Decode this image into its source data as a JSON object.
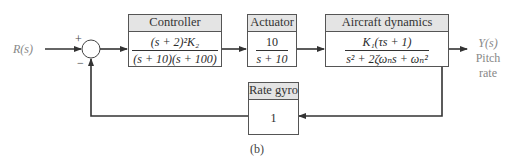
{
  "diagram": {
    "caption": "(b)",
    "input": {
      "label": "R(s)"
    },
    "summing_junction": {
      "plus_sign": "+",
      "minus_sign": "−"
    },
    "blocks": {
      "controller": {
        "title": "Controller",
        "numerator": "(s + 2)²K₂",
        "denominator": "(s + 10)(s + 100)"
      },
      "actuator": {
        "title": "Actuator",
        "numerator": "10",
        "denominator": "s + 10"
      },
      "aircraft": {
        "title": "Aircraft dynamics",
        "numerator": "K₁(τs + 1)",
        "denominator": "s² + 2ζωₙs + ωₙ²"
      },
      "rate_gyro": {
        "title": "Rate gyro",
        "value": "1"
      }
    },
    "output": {
      "label": "Y(s)",
      "line1": "Pitch",
      "line2": "rate"
    }
  },
  "colors": {
    "line": "#333333",
    "header_bg": "#e4e4e4",
    "output_text": "#888888"
  }
}
